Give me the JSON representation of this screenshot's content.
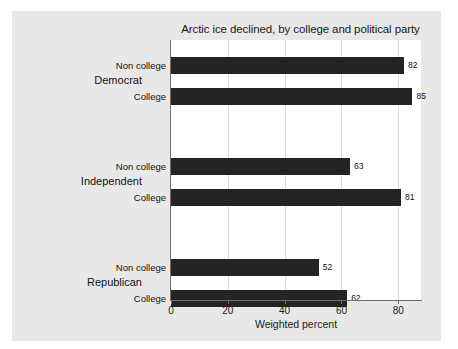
{
  "chart_data": {
    "type": "bar",
    "orientation": "horizontal",
    "title": "Arctic ice declined, by college and political party",
    "xlabel": "Weighted percent",
    "ylabel": "",
    "xlim": [
      0,
      88
    ],
    "xticks": [
      0,
      20,
      40,
      60,
      80
    ],
    "xtick_labels": [
      "0",
      "20",
      "40",
      "60",
      "80"
    ],
    "grid": true,
    "grid_axis": "x",
    "legend": false,
    "categories": [
      "Democrat - Non college",
      "Democrat - College",
      "Independent - Non college",
      "Independent - College",
      "Republican - Non college",
      "Republican - College"
    ],
    "values": [
      82,
      85,
      63,
      81,
      52,
      62
    ],
    "groups": [
      {
        "label": "Democrat",
        "bars": [
          {
            "label": "Non college",
            "value": 82,
            "value_text": "82"
          },
          {
            "label": "College",
            "value": 85,
            "value_text": "85"
          }
        ]
      },
      {
        "label": "Independent",
        "bars": [
          {
            "label": "Non college",
            "value": 63,
            "value_text": "63"
          },
          {
            "label": "College",
            "value": 81,
            "value_text": "81"
          }
        ]
      },
      {
        "label": "Republican",
        "bars": [
          {
            "label": "Non college",
            "value": 52,
            "value_text": "52"
          },
          {
            "label": "College",
            "value": 62,
            "value_text": "62"
          }
        ]
      }
    ],
    "colors": {
      "bar": "#242424",
      "panel_background": "#e8e8e8",
      "plot_background": "#ffffff",
      "gridline": "#dcdcdc",
      "axis": "#707070",
      "text": "#111111"
    }
  }
}
